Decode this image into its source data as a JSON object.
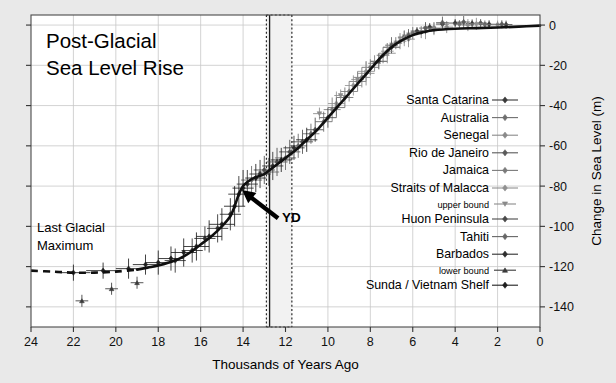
{
  "figure": {
    "title_line1": "Post-Glacial",
    "title_line2": "Sea Level Rise",
    "background_color": "#e9e9e9",
    "plot_background_color": "#ffffff"
  },
  "annotations": {
    "lgm_line1": "Last Glacial",
    "lgm_line2": "Maximum",
    "yd_label": "YD"
  },
  "chart_data": {
    "type": "scatter",
    "xlabel": "Thousands of Years Ago",
    "ylabel": "Change in Sea Level (m)",
    "xlim": [
      24,
      0
    ],
    "ylim": [
      -150,
      5
    ],
    "x_ticks": [
      24,
      22,
      20,
      18,
      16,
      14,
      12,
      10,
      8,
      6,
      4,
      2,
      0
    ],
    "y_ticks": [
      0,
      -20,
      -40,
      -60,
      -80,
      -100,
      -120,
      -140
    ],
    "x_tick_labels": [
      "24",
      "22",
      "20",
      "18",
      "16",
      "14",
      "12",
      "10",
      "8",
      "6",
      "4",
      "2",
      "0"
    ],
    "y_tick_labels": [
      "0",
      "-20",
      "-40",
      "-60",
      "-80",
      "-100",
      "-120",
      "-140"
    ],
    "grid": true,
    "grid_color": "#c8c8c8",
    "x_axis_reversed": true,
    "legend_position": "right-inside",
    "annotations": [
      {
        "text": "Post-Glacial Sea Level Rise",
        "x": 22.0,
        "y": -8
      },
      {
        "text": "Last Glacial Maximum",
        "x": 22.3,
        "y": -100
      },
      {
        "text": "YD",
        "x": 12.3,
        "y": -115
      },
      {
        "text": "Meltwater Pulse 1A arrow",
        "x": 13.4,
        "y": -83,
        "type": "arrow"
      }
    ],
    "shaded_bands": [
      {
        "name": "Younger Dryas",
        "x_start": 12.9,
        "x_end": 11.7,
        "style": "dotted-border",
        "fill": "#f2f2f2"
      }
    ],
    "vertical_lines": [
      {
        "name": "YD onset",
        "x": 12.75,
        "style": "solid",
        "color": "#1a1a1a"
      }
    ],
    "fitted_curve": {
      "name": "Smoothed sea level curve",
      "color": "#101010",
      "solid_segment_x_start": 19.0,
      "dashed_segment_x_range": [
        24.0,
        19.0
      ],
      "points": [
        {
          "x": 24.0,
          "y": -122
        },
        {
          "x": 23.0,
          "y": -122.5
        },
        {
          "x": 22.0,
          "y": -123
        },
        {
          "x": 21.0,
          "y": -123
        },
        {
          "x": 20.0,
          "y": -122.5
        },
        {
          "x": 19.0,
          "y": -121.5
        },
        {
          "x": 18.5,
          "y": -120.5
        },
        {
          "x": 18.0,
          "y": -119.5
        },
        {
          "x": 17.5,
          "y": -118
        },
        {
          "x": 17.0,
          "y": -116
        },
        {
          "x": 16.5,
          "y": -113
        },
        {
          "x": 16.0,
          "y": -109
        },
        {
          "x": 15.5,
          "y": -105
        },
        {
          "x": 15.0,
          "y": -100
        },
        {
          "x": 14.6,
          "y": -95
        },
        {
          "x": 14.4,
          "y": -90
        },
        {
          "x": 14.2,
          "y": -84
        },
        {
          "x": 14.0,
          "y": -80
        },
        {
          "x": 13.8,
          "y": -78
        },
        {
          "x": 13.5,
          "y": -76
        },
        {
          "x": 13.0,
          "y": -74
        },
        {
          "x": 12.5,
          "y": -70
        },
        {
          "x": 12.0,
          "y": -66
        },
        {
          "x": 11.5,
          "y": -62
        },
        {
          "x": 11.0,
          "y": -57
        },
        {
          "x": 10.5,
          "y": -52
        },
        {
          "x": 10.0,
          "y": -46
        },
        {
          "x": 9.5,
          "y": -40
        },
        {
          "x": 9.0,
          "y": -34
        },
        {
          "x": 8.5,
          "y": -28
        },
        {
          "x": 8.0,
          "y": -22
        },
        {
          "x": 7.5,
          "y": -16
        },
        {
          "x": 7.0,
          "y": -11
        },
        {
          "x": 6.5,
          "y": -7.5
        },
        {
          "x": 6.0,
          "y": -5
        },
        {
          "x": 5.5,
          "y": -3.5
        },
        {
          "x": 5.0,
          "y": -2.5
        },
        {
          "x": 4.0,
          "y": -1.8
        },
        {
          "x": 3.0,
          "y": -1.5
        },
        {
          "x": 2.0,
          "y": -1.2
        },
        {
          "x": 1.0,
          "y": -0.8
        },
        {
          "x": 0.0,
          "y": -0.3
        }
      ]
    },
    "series": [
      {
        "name": "Santa Catarina",
        "marker": "diamond",
        "color": "#3a3a3a",
        "points": [
          {
            "x": 7.6,
            "y": -18,
            "xerr": 0.4,
            "yerr": 4
          },
          {
            "x": 7.0,
            "y": -11,
            "xerr": 0.4,
            "yerr": 3
          },
          {
            "x": 6.4,
            "y": -6,
            "xerr": 0.3,
            "yerr": 3
          },
          {
            "x": 5.8,
            "y": -3,
            "xerr": 0.3,
            "yerr": 2
          },
          {
            "x": 5.2,
            "y": -1,
            "xerr": 0.3,
            "yerr": 2
          },
          {
            "x": 4.6,
            "y": 0.5,
            "xerr": 0.3,
            "yerr": 2
          },
          {
            "x": 4.0,
            "y": 1.0,
            "xerr": 0.3,
            "yerr": 2
          },
          {
            "x": 3.2,
            "y": 0.8,
            "xerr": 0.3,
            "yerr": 2
          },
          {
            "x": 2.4,
            "y": 0.4,
            "xerr": 0.3,
            "yerr": 2
          },
          {
            "x": 1.6,
            "y": 0.2,
            "xerr": 0.3,
            "yerr": 2
          }
        ]
      },
      {
        "name": "Australia",
        "marker": "diamond",
        "color": "#6e6e6e",
        "points": [
          {
            "x": 9.2,
            "y": -36,
            "xerr": 0.4,
            "yerr": 5
          },
          {
            "x": 8.6,
            "y": -28,
            "xerr": 0.4,
            "yerr": 5
          },
          {
            "x": 8.0,
            "y": -21,
            "xerr": 0.4,
            "yerr": 4
          },
          {
            "x": 7.4,
            "y": -15,
            "xerr": 0.3,
            "yerr": 4
          },
          {
            "x": 6.8,
            "y": -9,
            "xerr": 0.3,
            "yerr": 3
          },
          {
            "x": 6.0,
            "y": -4,
            "xerr": 0.3,
            "yerr": 3
          },
          {
            "x": 5.0,
            "y": -1.5,
            "xerr": 0.3,
            "yerr": 3
          },
          {
            "x": 3.8,
            "y": 0.5,
            "xerr": 0.3,
            "yerr": 2
          },
          {
            "x": 2.6,
            "y": 0.3,
            "xerr": 0.3,
            "yerr": 2
          }
        ]
      },
      {
        "name": "Senegal",
        "marker": "diamond",
        "color": "#8a8a8a",
        "points": [
          {
            "x": 8.2,
            "y": -24,
            "xerr": 0.4,
            "yerr": 6
          },
          {
            "x": 7.2,
            "y": -14,
            "xerr": 0.4,
            "yerr": 5
          },
          {
            "x": 6.2,
            "y": -7,
            "xerr": 0.3,
            "yerr": 4
          },
          {
            "x": 5.4,
            "y": -3,
            "xerr": 0.3,
            "yerr": 4
          },
          {
            "x": 4.4,
            "y": -1,
            "xerr": 0.3,
            "yerr": 3
          },
          {
            "x": 3.4,
            "y": 0.0,
            "xerr": 0.3,
            "yerr": 3
          },
          {
            "x": 2.0,
            "y": 0.2,
            "xerr": 0.3,
            "yerr": 2
          }
        ]
      },
      {
        "name": "Rio de Janeiro",
        "marker": "diamond",
        "color": "#5a5a5a",
        "points": [
          {
            "x": 7.0,
            "y": -10,
            "xerr": 0.3,
            "yerr": 4
          },
          {
            "x": 6.2,
            "y": -5,
            "xerr": 0.3,
            "yerr": 3
          },
          {
            "x": 5.4,
            "y": -1.5,
            "xerr": 0.3,
            "yerr": 3
          },
          {
            "x": 4.6,
            "y": 1.2,
            "xerr": 0.3,
            "yerr": 3
          },
          {
            "x": 3.6,
            "y": 1.5,
            "xerr": 0.3,
            "yerr": 3
          },
          {
            "x": 2.8,
            "y": 1.0,
            "xerr": 0.3,
            "yerr": 2
          },
          {
            "x": 1.8,
            "y": 0.4,
            "xerr": 0.3,
            "yerr": 2
          }
        ]
      },
      {
        "name": "Jamaica",
        "marker": "diamond",
        "color": "#7a7a7a",
        "points": [
          {
            "x": 9.8,
            "y": -42,
            "xerr": 0.4,
            "yerr": 6
          },
          {
            "x": 9.0,
            "y": -33,
            "xerr": 0.4,
            "yerr": 5
          },
          {
            "x": 8.4,
            "y": -26,
            "xerr": 0.4,
            "yerr": 5
          },
          {
            "x": 7.8,
            "y": -19,
            "xerr": 0.3,
            "yerr": 4
          },
          {
            "x": 6.6,
            "y": -8,
            "xerr": 0.3,
            "yerr": 4
          },
          {
            "x": 5.6,
            "y": -3.5,
            "xerr": 0.3,
            "yerr": 3
          }
        ]
      },
      {
        "name": "Straits of Malacca",
        "marker": "diamond",
        "color": "#909090",
        "points": [
          {
            "x": 9.6,
            "y": -39,
            "xerr": 0.4,
            "yerr": 6
          },
          {
            "x": 8.8,
            "y": -30,
            "xerr": 0.4,
            "yerr": 5
          },
          {
            "x": 8.2,
            "y": -23,
            "xerr": 0.4,
            "yerr": 5
          },
          {
            "x": 7.2,
            "y": -13,
            "xerr": 0.3,
            "yerr": 4
          },
          {
            "x": 6.4,
            "y": -6.5,
            "xerr": 0.3,
            "yerr": 4
          },
          {
            "x": 5.0,
            "y": -2,
            "xerr": 0.3,
            "yerr": 3
          },
          {
            "x": 3.0,
            "y": 0.6,
            "xerr": 0.3,
            "yerr": 3
          }
        ]
      },
      {
        "name": "upper bound",
        "marker": "triangle-down",
        "color": "#8a8a8a",
        "is_bound": true,
        "points": [
          {
            "x": 10.4,
            "y": -44,
            "xerr": 0.3,
            "yerr": 3
          },
          {
            "x": 9.4,
            "y": -35,
            "xerr": 0.3,
            "yerr": 3
          },
          {
            "x": 8.6,
            "y": -27,
            "xerr": 0.3,
            "yerr": 3
          }
        ]
      },
      {
        "name": "Huon Peninsula",
        "marker": "diamond",
        "color": "#4a4a4a",
        "points": [
          {
            "x": 13.0,
            "y": -72,
            "xerr": 0.5,
            "yerr": 7
          },
          {
            "x": 12.4,
            "y": -68,
            "xerr": 0.5,
            "yerr": 7
          },
          {
            "x": 11.8,
            "y": -63,
            "xerr": 0.5,
            "yerr": 6
          },
          {
            "x": 11.2,
            "y": -58,
            "xerr": 0.5,
            "yerr": 6
          },
          {
            "x": 10.6,
            "y": -52,
            "xerr": 0.4,
            "yerr": 6
          },
          {
            "x": 10.0,
            "y": -46,
            "xerr": 0.4,
            "yerr": 5
          }
        ]
      },
      {
        "name": "Tahiti",
        "marker": "diamond",
        "color": "#666666",
        "points": [
          {
            "x": 13.6,
            "y": -77,
            "xerr": 0.5,
            "yerr": 7
          },
          {
            "x": 12.8,
            "y": -73,
            "xerr": 0.5,
            "yerr": 7
          },
          {
            "x": 12.0,
            "y": -66,
            "xerr": 0.5,
            "yerr": 6
          },
          {
            "x": 11.4,
            "y": -60,
            "xerr": 0.4,
            "yerr": 6
          },
          {
            "x": 10.8,
            "y": -54,
            "xerr": 0.4,
            "yerr": 5
          },
          {
            "x": 10.2,
            "y": -48,
            "xerr": 0.4,
            "yerr": 5
          },
          {
            "x": 9.6,
            "y": -41,
            "xerr": 0.4,
            "yerr": 5
          }
        ]
      },
      {
        "name": "Barbados",
        "marker": "diamond",
        "color": "#2e2e2e",
        "points": [
          {
            "x": 17.2,
            "y": -117,
            "xerr": 0.5,
            "yerr": 6
          },
          {
            "x": 16.4,
            "y": -112,
            "xerr": 0.5,
            "yerr": 6
          },
          {
            "x": 15.8,
            "y": -106,
            "xerr": 0.5,
            "yerr": 6
          },
          {
            "x": 15.2,
            "y": -101,
            "xerr": 0.5,
            "yerr": 7
          },
          {
            "x": 14.6,
            "y": -94,
            "xerr": 0.5,
            "yerr": 8
          },
          {
            "x": 14.2,
            "y": -84,
            "xerr": 0.5,
            "yerr": 9
          },
          {
            "x": 13.8,
            "y": -79,
            "xerr": 0.5,
            "yerr": 7
          },
          {
            "x": 13.2,
            "y": -74,
            "xerr": 0.5,
            "yerr": 7
          },
          {
            "x": 12.6,
            "y": -70,
            "xerr": 0.5,
            "yerr": 7
          },
          {
            "x": 11.6,
            "y": -61,
            "xerr": 0.5,
            "yerr": 6
          }
        ]
      },
      {
        "name": "lower bound",
        "marker": "triangle-up",
        "color": "#3a3a3a",
        "is_bound": true,
        "points": [
          {
            "x": 21.6,
            "y": -137,
            "xerr": 0.3,
            "yerr": 3
          },
          {
            "x": 20.2,
            "y": -131,
            "xerr": 0.3,
            "yerr": 3
          },
          {
            "x": 19.0,
            "y": -128,
            "xerr": 0.3,
            "yerr": 3
          }
        ]
      },
      {
        "name": "Sunda / Vietnam Shelf",
        "marker": "diamond",
        "color": "#1f1f1f",
        "points": [
          {
            "x": 19.4,
            "y": -121,
            "xerr": 0.6,
            "yerr": 5
          },
          {
            "x": 18.6,
            "y": -119,
            "xerr": 0.6,
            "yerr": 5
          },
          {
            "x": 18.0,
            "y": -118,
            "xerr": 0.6,
            "yerr": 6
          },
          {
            "x": 17.4,
            "y": -116,
            "xerr": 0.6,
            "yerr": 6
          },
          {
            "x": 16.8,
            "y": -113,
            "xerr": 0.6,
            "yerr": 7
          },
          {
            "x": 16.2,
            "y": -110,
            "xerr": 0.6,
            "yerr": 7
          },
          {
            "x": 15.6,
            "y": -105,
            "xerr": 0.6,
            "yerr": 8
          },
          {
            "x": 15.0,
            "y": -99,
            "xerr": 0.6,
            "yerr": 8
          },
          {
            "x": 14.4,
            "y": -90,
            "xerr": 0.5,
            "yerr": 10
          },
          {
            "x": 14.0,
            "y": -81,
            "xerr": 0.5,
            "yerr": 9
          },
          {
            "x": 13.4,
            "y": -76,
            "xerr": 0.5,
            "yerr": 7
          },
          {
            "x": 12.2,
            "y": -67,
            "xerr": 0.5,
            "yerr": 6
          },
          {
            "x": 11.0,
            "y": -57,
            "xerr": 0.5,
            "yerr": 6
          },
          {
            "x": 22.0,
            "y": -123,
            "xerr": 0.8,
            "yerr": 4
          },
          {
            "x": 20.6,
            "y": -122,
            "xerr": 0.8,
            "yerr": 4
          }
        ]
      }
    ],
    "legend_entries": [
      {
        "label": "Santa Catarina",
        "marker": "diamond",
        "color": "#3a3a3a",
        "small": false
      },
      {
        "label": "Australia",
        "marker": "diamond",
        "color": "#6e6e6e",
        "small": false
      },
      {
        "label": "Senegal",
        "marker": "diamond",
        "color": "#8a8a8a",
        "small": false
      },
      {
        "label": "Rio de Janeiro",
        "marker": "diamond",
        "color": "#5a5a5a",
        "small": false
      },
      {
        "label": "Jamaica",
        "marker": "diamond",
        "color": "#7a7a7a",
        "small": false
      },
      {
        "label": "Straits of Malacca",
        "marker": "diamond",
        "color": "#909090",
        "small": false
      },
      {
        "label": "upper bound",
        "marker": "triangle-down",
        "color": "#8a8a8a",
        "small": true
      },
      {
        "label": "Huon Peninsula",
        "marker": "diamond",
        "color": "#4a4a4a",
        "small": false
      },
      {
        "label": "Tahiti",
        "marker": "diamond",
        "color": "#666666",
        "small": false
      },
      {
        "label": "Barbados",
        "marker": "diamond",
        "color": "#2e2e2e",
        "small": false
      },
      {
        "label": "lower bound",
        "marker": "triangle-up",
        "color": "#3a3a3a",
        "small": true
      },
      {
        "label": "Sunda / Vietnam Shelf",
        "marker": "diamond",
        "color": "#1f1f1f",
        "small": false
      }
    ]
  }
}
